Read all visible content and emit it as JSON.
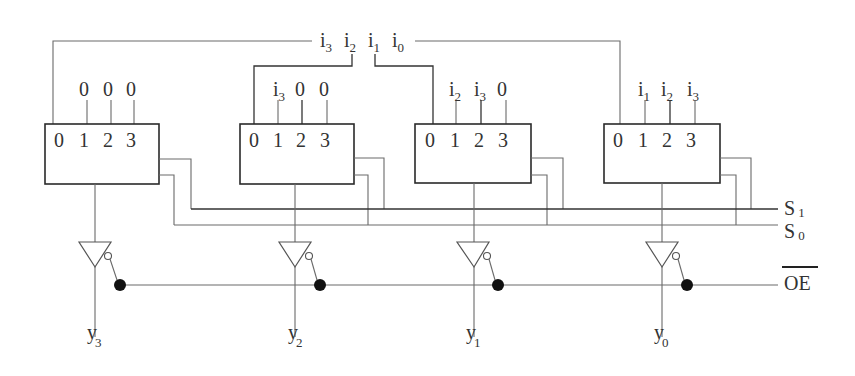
{
  "diagram": {
    "input_bus": {
      "labels": [
        {
          "base": "i",
          "sub": "3"
        },
        {
          "base": "i",
          "sub": "2"
        },
        {
          "base": "i",
          "sub": "1"
        },
        {
          "base": "i",
          "sub": "0"
        }
      ]
    },
    "muxes": [
      {
        "id": "mux3",
        "pin_labels": [
          "0",
          "1",
          "2",
          "3"
        ],
        "input_labels": [
          {
            "base": "0",
            "sub": ""
          },
          {
            "base": "0",
            "sub": ""
          },
          {
            "base": "0",
            "sub": ""
          }
        ],
        "output": {
          "base": "y",
          "sub": "3"
        }
      },
      {
        "id": "mux2",
        "pin_labels": [
          "0",
          "1",
          "2",
          "3"
        ],
        "input_labels": [
          {
            "base": "i",
            "sub": "3"
          },
          {
            "base": "0",
            "sub": ""
          },
          {
            "base": "0",
            "sub": ""
          }
        ],
        "output": {
          "base": "y",
          "sub": "2"
        }
      },
      {
        "id": "mux1",
        "pin_labels": [
          "0",
          "1",
          "2",
          "3"
        ],
        "input_labels": [
          {
            "base": "i",
            "sub": "2"
          },
          {
            "base": "i",
            "sub": "3"
          },
          {
            "base": "0",
            "sub": ""
          }
        ],
        "output": {
          "base": "y",
          "sub": "1"
        }
      },
      {
        "id": "mux0",
        "pin_labels": [
          "0",
          "1",
          "2",
          "3"
        ],
        "input_labels": [
          {
            "base": "i",
            "sub": "1"
          },
          {
            "base": "i",
            "sub": "2"
          },
          {
            "base": "i",
            "sub": "3"
          }
        ],
        "output": {
          "base": "y",
          "sub": "0"
        }
      }
    ],
    "select_lines": [
      {
        "base": "S",
        "sub": "1"
      },
      {
        "base": "S",
        "sub": "0"
      }
    ],
    "enable": {
      "label": "OE",
      "active_low": true
    },
    "colors": {
      "wire": "#6a6a6a",
      "box": "#2a2a2a",
      "junction": "#111111",
      "text": "#333333"
    }
  }
}
